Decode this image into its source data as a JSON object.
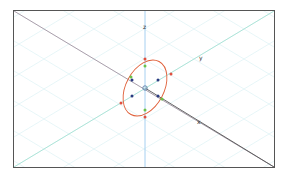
{
  "viewport": {
    "title": "3D Viewport",
    "axes": [
      {
        "name": "x",
        "label": "x",
        "color": "#8a6f80"
      },
      {
        "name": "y",
        "label": "y",
        "color": "#7fd8c8"
      },
      {
        "name": "z",
        "label": "z",
        "color": "#6fb0e0"
      }
    ],
    "grid_color": "#d6f0f4",
    "ellipse_color": "#e0603a",
    "point_colors": {
      "red": "#e05040",
      "green": "#6cc24a",
      "blue": "#2a3a80",
      "origin": "#6a8ab0"
    }
  }
}
